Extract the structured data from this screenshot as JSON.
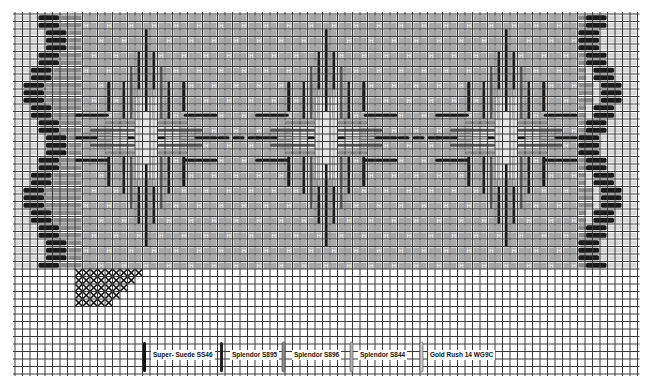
{
  "chart": {
    "grid": {
      "left": 15,
      "top": 14,
      "cell": 7.5,
      "cols": 83,
      "rows": 48,
      "line_color": "#3a3a3a",
      "background": "#ffffff"
    },
    "colors": {
      "black_thread": "#1a1a1a",
      "dark_gray_thread": "#555555",
      "mid_gray_thread": "#8a8a8a",
      "light_gray_thread": "#bdbdbd",
      "field_fill": "#a8a8a8",
      "border_light": "#d8d8d8"
    },
    "field": {
      "col_start": 9,
      "col_end": 75,
      "row_start": 0,
      "row_end": 34,
      "accent_symbol": "H"
    },
    "borders": {
      "left_black_offsets": [
        3,
        3,
        4,
        4,
        4,
        3,
        3,
        2,
        2,
        1,
        1,
        1,
        2,
        2,
        3,
        3,
        4,
        4,
        4,
        3,
        3,
        2,
        2,
        1,
        1,
        1,
        2,
        2,
        3,
        3,
        4,
        4,
        4,
        3,
        3
      ],
      "right_black_offsets": [
        3,
        3,
        2,
        2,
        2,
        3,
        3,
        4,
        4,
        5,
        5,
        5,
        4,
        4,
        3,
        3,
        2,
        2,
        2,
        3,
        3,
        4,
        4,
        5,
        5,
        5,
        4,
        4,
        3,
        3,
        2,
        2,
        2,
        3,
        3
      ]
    },
    "motifs": [
      {
        "name": "diamond-1",
        "center_col": 17,
        "center_row": 16
      },
      {
        "name": "diamond-2",
        "center_col": 41,
        "center_row": 16
      },
      {
        "name": "diamond-3",
        "center_col": 65,
        "center_row": 16
      }
    ],
    "cross_stitch_sample": {
      "col_start": 8,
      "col_end": 17,
      "row_start": 34,
      "row_end": 39
    }
  },
  "legend": {
    "items": [
      {
        "label": "Super- Suede SS46",
        "color": "#111111",
        "x": 143,
        "label_x": 151
      },
      {
        "label": "Splendor S895",
        "color": "#222222",
        "x": 220,
        "label_x": 230
      },
      {
        "label": "Splendor S896",
        "color": "#8a8a8a",
        "x": 282,
        "label_x": 292
      },
      {
        "label": "Splendor S844",
        "color": "#b0b0b0",
        "x": 350,
        "label_x": 358
      },
      {
        "label": "Gold Rush 14 WG9C",
        "color": "#cfcfcf",
        "x": 420,
        "label_x": 428
      }
    ],
    "y_top": 342,
    "y_bottom": 372
  }
}
